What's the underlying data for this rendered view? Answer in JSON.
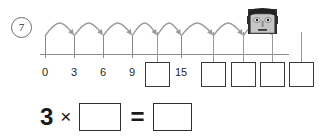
{
  "worksheet": {
    "question_number": "7",
    "number_line": {
      "start_label": "0",
      "step": 3,
      "ticks": [
        {
          "value": "0",
          "label": "0",
          "x": 45,
          "type": "label"
        },
        {
          "value": "3",
          "label": "3",
          "x": 74,
          "type": "label"
        },
        {
          "value": "6",
          "label": "6",
          "x": 103,
          "type": "label"
        },
        {
          "value": "9",
          "label": "9",
          "x": 132,
          "type": "label"
        },
        {
          "value": "12",
          "label": "",
          "x": 157,
          "type": "box"
        },
        {
          "value": "15",
          "label": "15",
          "x": 181,
          "type": "label"
        },
        {
          "value": "18",
          "label": "",
          "x": 213,
          "type": "box"
        },
        {
          "value": "21",
          "label": "",
          "x": 243,
          "type": "box"
        },
        {
          "value": "24",
          "label": "",
          "x": 272,
          "type": "box"
        },
        {
          "value": "27",
          "label": "",
          "x": 301,
          "type": "box"
        }
      ],
      "hop_count": 8,
      "axis_color": "#8a8a8a",
      "arc_color": "#9a9a9a"
    },
    "character": {
      "name": "cartoon-head",
      "hair_color": "#2b2b2b",
      "face_color": "#c9c9c9"
    },
    "equation": {
      "factor": "3",
      "times_symbol": "×",
      "equals_symbol": "=",
      "operand_value": "",
      "result_value": ""
    }
  }
}
